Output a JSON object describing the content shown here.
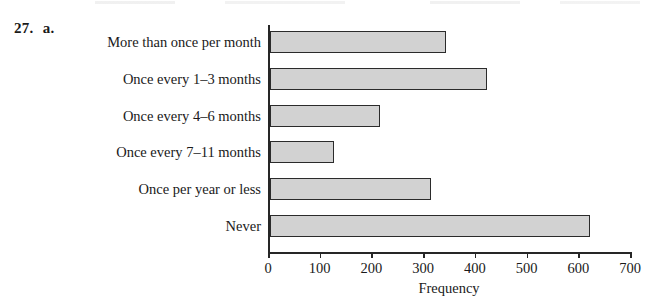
{
  "figure": {
    "exercise_number": "27.",
    "part_label": "a."
  },
  "chart_data": {
    "type": "bar",
    "orientation": "horizontal",
    "title": "",
    "subtitle": "",
    "xlabel": "Frequency",
    "ylabel": "",
    "categories": [
      "More than once per month",
      "Once every 1–3 months",
      "Once every 4–6 months",
      "Once every 7–11 months",
      "Once per year or less",
      "Never"
    ],
    "values": [
      340,
      420,
      213,
      124,
      311,
      619
    ],
    "xlim": [
      0,
      700
    ],
    "xticks": [
      0,
      100,
      200,
      300,
      400,
      500,
      600,
      700
    ],
    "xtick_labels": [
      "0",
      "100",
      "200",
      "300",
      "400",
      "500",
      "600",
      "700"
    ],
    "grid": false,
    "legend": false,
    "bar_fill_color": "#d2d2d2",
    "bar_edge_color": "#2b2b2b",
    "axis_color": "#262626"
  }
}
